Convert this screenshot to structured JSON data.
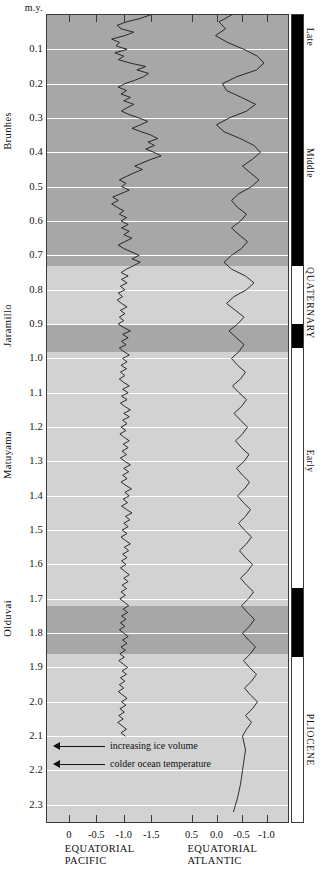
{
  "figure": {
    "y_axis_header": "m.y.",
    "y_ticks": [
      "0.1",
      "0.2",
      "0.3",
      "0.4",
      "0.5",
      "0.6",
      "0.7",
      "0.8",
      "0.9",
      "1.0",
      "1.1",
      "1.2",
      "1.3",
      "1.4",
      "1.5",
      "1.6",
      "1.7",
      "1.8",
      "1.9",
      "2.0",
      "2.1",
      "2.2",
      "2.3"
    ],
    "chrons": [
      {
        "label": "Brunhes",
        "center_my": 0.37
      },
      {
        "label": "Jaramillo",
        "center_my": 0.93
      },
      {
        "label": "Matuyama",
        "center_my": 1.3
      },
      {
        "label": "Olduvai",
        "center_my": 1.79
      }
    ],
    "epochs": [
      {
        "label": "Late",
        "from_my": 0.0,
        "to_my": 0.13
      },
      {
        "label": "Middle",
        "from_my": 0.13,
        "to_my": 0.73
      },
      {
        "label": "QUATERNARY",
        "from_my": 0.73,
        "to_my": 0.95
      },
      {
        "label": "Early",
        "from_my": 0.95,
        "to_my": 1.65
      },
      {
        "label": "PLIOCENE",
        "from_my": 1.87,
        "to_my": 2.35
      }
    ],
    "polarity_normal_intervals": [
      {
        "from_my": 0.0,
        "to_my": 0.73
      },
      {
        "from_my": 0.9,
        "to_my": 0.97
      },
      {
        "from_my": 1.67,
        "to_my": 1.87
      }
    ],
    "shaded_bands": [
      {
        "from_my": 0.0,
        "to_my": 0.73
      },
      {
        "from_my": 0.9,
        "to_my": 0.98
      },
      {
        "from_my": 1.72,
        "to_my": 1.86
      }
    ],
    "annotations": [
      {
        "text": "increasing ice volume",
        "at_my": 2.13
      },
      {
        "text": "colder ocean temperature",
        "at_my": 2.18
      }
    ]
  },
  "chart_data": {
    "type": "line",
    "title": "",
    "ylabel": "m.y.",
    "ylim": [
      0.0,
      2.35
    ],
    "grid": true,
    "legend": "none",
    "orientation": "vertical-depth",
    "panels": [
      {
        "name": "EQUATORIAL PACIFIC",
        "xlabel_lines": [
          "EQUATORIAL",
          "PACIFIC"
        ],
        "xticks": [
          "0",
          "-0.5",
          "-1.0",
          "-1.5"
        ],
        "xtick_values": [
          0,
          -0.5,
          -1.0,
          -1.5
        ],
        "xlim": [
          0.25,
          -1.75
        ],
        "series_name": "delta-O18 equatorial Pacific",
        "y": [
          0.0,
          0.01,
          0.02,
          0.03,
          0.04,
          0.05,
          0.06,
          0.07,
          0.08,
          0.09,
          0.1,
          0.11,
          0.12,
          0.13,
          0.14,
          0.15,
          0.16,
          0.17,
          0.18,
          0.19,
          0.2,
          0.21,
          0.22,
          0.23,
          0.24,
          0.25,
          0.26,
          0.27,
          0.28,
          0.29,
          0.3,
          0.31,
          0.32,
          0.33,
          0.34,
          0.35,
          0.36,
          0.37,
          0.38,
          0.39,
          0.4,
          0.41,
          0.42,
          0.43,
          0.44,
          0.45,
          0.46,
          0.47,
          0.48,
          0.49,
          0.5,
          0.51,
          0.52,
          0.53,
          0.54,
          0.55,
          0.56,
          0.57,
          0.58,
          0.59,
          0.6,
          0.61,
          0.62,
          0.63,
          0.64,
          0.65,
          0.66,
          0.67,
          0.68,
          0.69,
          0.7,
          0.71,
          0.72,
          0.73,
          0.74,
          0.75,
          0.76,
          0.77,
          0.78,
          0.79,
          0.8,
          0.81,
          0.82,
          0.83,
          0.84,
          0.85,
          0.86,
          0.87,
          0.88,
          0.89,
          0.9,
          0.91,
          0.92,
          0.93,
          0.94,
          0.95,
          0.96,
          0.97,
          0.98,
          0.99,
          1.0,
          1.01,
          1.02,
          1.03,
          1.04,
          1.05,
          1.06,
          1.07,
          1.08,
          1.09,
          1.1,
          1.11,
          1.12,
          1.13,
          1.14,
          1.15,
          1.16,
          1.17,
          1.18,
          1.19,
          1.2,
          1.21,
          1.22,
          1.23,
          1.24,
          1.25,
          1.26,
          1.27,
          1.28,
          1.29,
          1.3,
          1.31,
          1.32,
          1.33,
          1.34,
          1.35,
          1.36,
          1.37,
          1.38,
          1.39,
          1.4,
          1.41,
          1.42,
          1.43,
          1.44,
          1.45,
          1.46,
          1.47,
          1.48,
          1.49,
          1.5,
          1.51,
          1.52,
          1.53,
          1.54,
          1.55,
          1.56,
          1.57,
          1.58,
          1.59,
          1.6,
          1.61,
          1.62,
          1.63,
          1.64,
          1.65,
          1.66,
          1.67,
          1.68,
          1.69,
          1.7,
          1.71,
          1.72,
          1.73,
          1.74,
          1.75,
          1.76,
          1.77,
          1.78,
          1.79,
          1.8,
          1.81,
          1.82,
          1.83,
          1.84,
          1.85,
          1.86,
          1.87,
          1.88,
          1.89,
          1.9,
          1.91,
          1.92,
          1.93,
          1.94,
          1.95,
          1.96,
          1.97,
          1.98,
          1.99,
          2.0,
          2.01,
          2.02,
          2.03,
          2.04,
          2.05,
          2.06,
          2.07,
          2.08,
          2.09,
          2.1
        ],
        "x": [
          -1.48,
          -1.3,
          -1.05,
          -0.88,
          -0.95,
          -1.18,
          -1.02,
          -0.78,
          -0.92,
          -0.86,
          -1.06,
          -0.84,
          -1.0,
          -0.9,
          -1.12,
          -1.4,
          -1.24,
          -1.45,
          -1.36,
          -1.2,
          -1.02,
          -0.9,
          -1.05,
          -0.95,
          -1.12,
          -1.0,
          -1.18,
          -1.06,
          -0.96,
          -1.1,
          -1.28,
          -1.44,
          -1.3,
          -1.15,
          -1.32,
          -1.5,
          -1.62,
          -1.44,
          -1.56,
          -1.4,
          -1.55,
          -1.68,
          -1.5,
          -1.35,
          -1.2,
          -1.34,
          -1.18,
          -1.05,
          -0.92,
          -1.04,
          -0.96,
          -1.1,
          -0.95,
          -0.8,
          -0.9,
          -0.78,
          -0.88,
          -1.0,
          -0.92,
          -1.05,
          -0.95,
          -1.08,
          -0.96,
          -1.1,
          -1.0,
          -1.15,
          -1.02,
          -0.9,
          -1.0,
          -1.14,
          -1.28,
          -1.15,
          -1.3,
          -1.18,
          -1.05,
          -0.95,
          -1.08,
          -0.96,
          -1.06,
          -0.94,
          -1.02,
          -0.9,
          -0.98,
          -0.88,
          -0.96,
          -1.06,
          -0.94,
          -1.02,
          -0.92,
          -1.0,
          -0.9,
          -1.0,
          -1.12,
          -0.98,
          -1.08,
          -0.96,
          -1.04,
          -0.92,
          -1.0,
          -1.1,
          -0.98,
          -1.06,
          -0.95,
          -1.05,
          -0.94,
          -1.02,
          -0.92,
          -1.0,
          -1.1,
          -0.98,
          -1.08,
          -0.96,
          -1.06,
          -0.94,
          -1.02,
          -1.12,
          -1.0,
          -1.1,
          -0.98,
          -1.06,
          -0.95,
          -1.04,
          -0.93,
          -1.01,
          -1.1,
          -0.99,
          -1.08,
          -0.97,
          -1.05,
          -0.94,
          -1.02,
          -1.12,
          -1.0,
          -1.09,
          -0.98,
          -1.06,
          -0.95,
          -1.04,
          -1.14,
          -1.02,
          -1.1,
          -0.99,
          -1.07,
          -0.96,
          -1.05,
          -1.15,
          -1.03,
          -1.11,
          -1.0,
          -1.08,
          -0.97,
          -1.06,
          -0.95,
          -1.03,
          -1.12,
          -1.01,
          -1.09,
          -0.98,
          -1.06,
          -0.96,
          -1.04,
          -0.94,
          -1.02,
          -1.1,
          -1.0,
          -1.08,
          -0.97,
          -1.05,
          -0.95,
          -1.03,
          -0.93,
          -1.01,
          -1.09,
          -0.99,
          -1.07,
          -0.96,
          -1.04,
          -0.94,
          -1.02,
          -0.92,
          -1.0,
          -1.08,
          -0.98,
          -1.06,
          -0.95,
          -1.03,
          -0.93,
          -1.01,
          -0.91,
          -0.99,
          -1.07,
          -0.97,
          -1.05,
          -0.94,
          -1.02,
          -0.92,
          -1.0,
          -0.9,
          -0.98,
          -1.06,
          -0.96,
          -1.04,
          -0.93,
          -1.01,
          -0.91,
          -0.99,
          -0.89,
          -0.97,
          -1.05,
          -0.95,
          -1.03,
          -0.92
        ]
      },
      {
        "name": "EQUATORIAL ATLANTIC",
        "xlabel_lines": [
          "EQUATORIAL",
          "ATLANTIC"
        ],
        "xticks": [
          "0.5",
          "0.0",
          "-0.5",
          "-1.0"
        ],
        "xtick_values": [
          0.5,
          0.0,
          -0.5,
          -1.0
        ],
        "xlim": [
          0.75,
          -1.25
        ],
        "series_name": "delta-O18 equatorial Atlantic",
        "y": [
          0.0,
          0.02,
          0.04,
          0.06,
          0.08,
          0.1,
          0.12,
          0.14,
          0.16,
          0.18,
          0.2,
          0.22,
          0.24,
          0.26,
          0.28,
          0.3,
          0.32,
          0.34,
          0.36,
          0.38,
          0.4,
          0.42,
          0.44,
          0.46,
          0.48,
          0.5,
          0.52,
          0.54,
          0.56,
          0.58,
          0.6,
          0.62,
          0.64,
          0.66,
          0.68,
          0.7,
          0.72,
          0.74,
          0.76,
          0.78,
          0.8,
          0.82,
          0.84,
          0.86,
          0.88,
          0.9,
          0.92,
          0.94,
          0.96,
          0.98,
          1.0,
          1.02,
          1.04,
          1.06,
          1.08,
          1.1,
          1.12,
          1.14,
          1.16,
          1.18,
          1.2,
          1.22,
          1.24,
          1.26,
          1.28,
          1.3,
          1.32,
          1.34,
          1.36,
          1.38,
          1.4,
          1.42,
          1.44,
          1.46,
          1.48,
          1.5,
          1.52,
          1.54,
          1.56,
          1.58,
          1.6,
          1.62,
          1.64,
          1.66,
          1.68,
          1.7,
          1.72,
          1.74,
          1.76,
          1.78,
          1.8,
          1.82,
          1.84,
          1.86,
          1.88,
          1.9,
          1.92,
          1.94,
          1.96,
          1.98,
          2.0,
          2.02,
          2.04,
          2.06,
          2.08,
          2.1,
          2.12,
          2.14,
          2.16,
          2.18,
          2.2,
          2.22,
          2.24,
          2.26,
          2.28,
          2.3,
          2.32,
          2.34
        ],
        "x": [
          -0.3,
          -0.05,
          -0.18,
          0.02,
          -0.22,
          -0.55,
          -0.82,
          -0.95,
          -0.8,
          -0.4,
          -0.12,
          -0.2,
          -0.5,
          -0.78,
          -0.6,
          -0.25,
          0.0,
          -0.15,
          -0.48,
          -0.75,
          -0.88,
          -0.72,
          -0.52,
          -0.68,
          -0.85,
          -0.7,
          -0.45,
          -0.3,
          -0.42,
          -0.6,
          -0.48,
          -0.3,
          -0.45,
          -0.62,
          -0.5,
          -0.3,
          -0.15,
          -0.3,
          -0.58,
          -0.75,
          -0.6,
          -0.35,
          -0.2,
          -0.38,
          -0.55,
          -0.42,
          -0.25,
          -0.4,
          -0.55,
          -0.45,
          -0.3,
          -0.42,
          -0.58,
          -0.48,
          -0.32,
          -0.45,
          -0.6,
          -0.5,
          -0.35,
          -0.48,
          -0.62,
          -0.52,
          -0.38,
          -0.5,
          -0.65,
          -0.55,
          -0.4,
          -0.52,
          -0.66,
          -0.56,
          -0.42,
          -0.54,
          -0.68,
          -0.58,
          -0.44,
          -0.56,
          -0.7,
          -0.6,
          -0.46,
          -0.58,
          -0.72,
          -0.62,
          -0.48,
          -0.6,
          -0.74,
          -0.64,
          -0.5,
          -0.62,
          -0.76,
          -0.66,
          -0.52,
          -0.64,
          -0.78,
          -0.68,
          -0.54,
          -0.66,
          -0.8,
          -0.7,
          -0.56,
          -0.68,
          -0.82,
          -0.72,
          -0.58,
          -0.7,
          -0.6,
          -0.52,
          -0.55,
          -0.58,
          -0.56,
          -0.54,
          -0.52,
          -0.5,
          -0.48,
          -0.45,
          -0.42,
          -0.38,
          -0.34
        ]
      }
    ]
  }
}
